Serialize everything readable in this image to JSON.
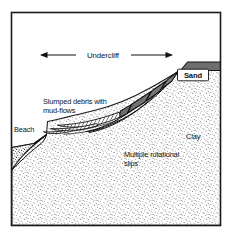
{
  "figure": {
    "kind": "geological-cross-section",
    "title_alt": "Coastal undercliff cross-section with multiple rotational slips",
    "frame": {
      "border_color": "#1a1a1a",
      "background_color": "#ffffff",
      "x": 11,
      "y": 12,
      "width": 210,
      "height": 214
    },
    "colors": {
      "ink": "#111111",
      "sand_band": "#6e6e6e",
      "slump_block": "#7a7a7a",
      "clay_stipple": "#5a5a5a",
      "beach_stipple": "#3f3f3f",
      "mudflow_hatch": "#222222",
      "white": "#ffffff"
    },
    "labels": {
      "undercliff": "Undercliff",
      "sand": "Sand",
      "slumped_debris_line1": "Slumped debris with",
      "slumped_debris_line2": "mud-flows",
      "beach": "Beach",
      "clay": "Clay",
      "multiple_slips_line1": "Multiple rotational",
      "multiple_slips_line2": "slips"
    },
    "annotations": {
      "extent_arrow": {
        "name": "undercliff-extent-arrow",
        "from_x": 40,
        "to_x": 173,
        "y": 55,
        "double_headed": true
      }
    },
    "units": {
      "sand": {
        "name": "Sand",
        "description": "Dark grey sand capping bed at top right of cliff",
        "pattern": "solid-grey"
      },
      "clay": {
        "name": "Clay",
        "description": "Stippled clay mass forming the bulk of the cliff and undercliff",
        "pattern": "stipple"
      },
      "beach": {
        "name": "Beach",
        "description": "Stippled beach wedge at the foot of the cliff, bottom left",
        "pattern": "dense-stipple"
      },
      "slumped_debris": {
        "name": "Slumped debris with mud-flows",
        "description": "Hatched lobate mud-flow tongues over the lower undercliff apron",
        "pattern": "hatch"
      },
      "rotational_slips": {
        "name": "Multiple rotational slips",
        "description": "Back-tilted slump blocks detached along concave-up slip surfaces",
        "block_count": 4,
        "slip_surface_count": 4
      }
    }
  }
}
